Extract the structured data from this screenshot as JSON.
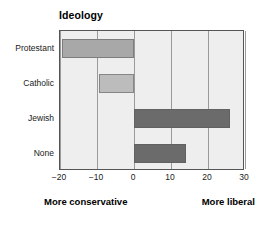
{
  "chart_data": {
    "type": "bar",
    "orientation": "horizontal",
    "title": "Ideology",
    "xlabel": "",
    "ylabel": "",
    "categories": [
      "Protestant",
      "Catholic",
      "Jewish",
      "None"
    ],
    "values": [
      -19.5,
      -9.5,
      26,
      14
    ],
    "xlim": [
      -20,
      30
    ],
    "xticks": [
      -20,
      -10,
      0,
      10,
      20,
      30
    ],
    "xtick_labels": [
      "−20",
      "−10",
      "0",
      "10",
      "20",
      "30"
    ],
    "grid": true,
    "grid_axis": "x",
    "legend": false,
    "bar_colors": [
      "#a8a8a8",
      "#bcbcbc",
      "#6b6b6b",
      "#6b6b6b"
    ],
    "plot_background": "#eeeeee",
    "frame_color": "#555555",
    "gridline_color": "#9a9a9a",
    "annotations": [
      {
        "text": "More conservative",
        "position": "bottom-left"
      },
      {
        "text": "More liberal",
        "position": "bottom-right"
      }
    ]
  },
  "footer": {
    "left_label": "More conservative",
    "right_label": "More liberal"
  }
}
